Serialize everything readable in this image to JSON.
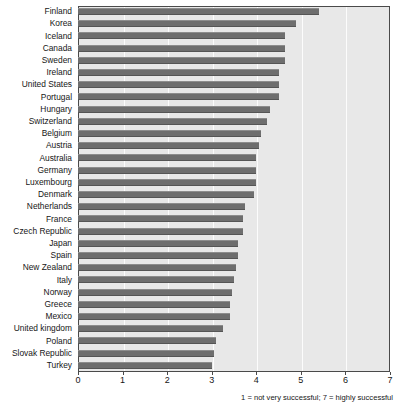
{
  "chart_data": {
    "type": "bar",
    "orientation": "horizontal",
    "title": "",
    "subtitle": "",
    "xlabel": "",
    "ylabel": "",
    "xlim": [
      0,
      7
    ],
    "xticks": [
      "0",
      "1",
      "2",
      "3",
      "4",
      "5",
      "6",
      "7"
    ],
    "grid": true,
    "grid_axis": "x",
    "legend": "none",
    "note": "1 = not very successful; 7 = highly successful",
    "categories": [
      "Finland",
      "Korea",
      "Iceland",
      "Canada",
      "Sweden",
      "Ireland",
      "United States",
      "Portugal",
      "Hungary",
      "Switzerland",
      "Belgium",
      "Austria",
      "Australia",
      "Germany",
      "Luxembourg",
      "Denmark",
      "Netherlands",
      "France",
      "Czech Republic",
      "Japan",
      "Spain",
      "New Zealand",
      "Italy",
      "Norway",
      "Greece",
      "Mexico",
      "United kingdom",
      "Poland",
      "Slovak Republic",
      "Turkey"
    ],
    "values": [
      5.4,
      4.9,
      4.65,
      4.65,
      4.65,
      4.5,
      4.5,
      4.5,
      4.3,
      4.25,
      4.1,
      4.05,
      4.0,
      4.0,
      4.0,
      3.95,
      3.75,
      3.7,
      3.7,
      3.6,
      3.6,
      3.55,
      3.5,
      3.45,
      3.4,
      3.4,
      3.25,
      3.1,
      3.05,
      3.0
    ],
    "colors": {
      "bar": "#6e6e6e",
      "plot_background": "#e8e8e8",
      "gridline": "#fcfcfc",
      "frame": "#4a4a4a",
      "text": "#161616"
    }
  }
}
